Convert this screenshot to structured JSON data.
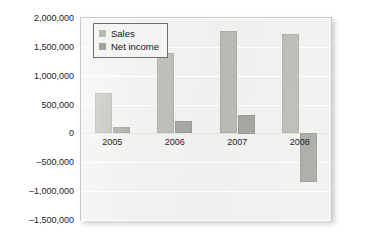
{
  "chart_data": {
    "type": "bar",
    "title": "",
    "subtitle": "",
    "xlabel": "",
    "ylabel": "",
    "categories": [
      "2005",
      "2006",
      "2007",
      "2008"
    ],
    "series": [
      {
        "name": "Sales",
        "color": "#b9b9b4",
        "values": [
          700000,
          1400000,
          1780000,
          1720000
        ]
      },
      {
        "name": "Net income",
        "color": "#a3a39e",
        "values": [
          120000,
          220000,
          320000,
          -850000
        ]
      }
    ],
    "ylim": [
      -1500000,
      2000000
    ],
    "ytick_values": [
      2000000,
      1500000,
      1000000,
      500000,
      0,
      -500000,
      -1000000,
      -1500000
    ],
    "ytick_labels": [
      "2,000,000",
      "1,500,000",
      "1,000,000",
      "500,000",
      "0",
      "–500,000",
      "–1,000,000",
      "–1,500,000"
    ],
    "grid": true,
    "grid_axis": "y",
    "legend_position": "top-left",
    "plot_background": "#f0f0ee",
    "gridline_color": "#ffffff"
  },
  "legend": {
    "entries": [
      {
        "label": "Sales",
        "color": "#b9b9b4"
      },
      {
        "label": "Net income",
        "color": "#a3a39e"
      }
    ]
  }
}
